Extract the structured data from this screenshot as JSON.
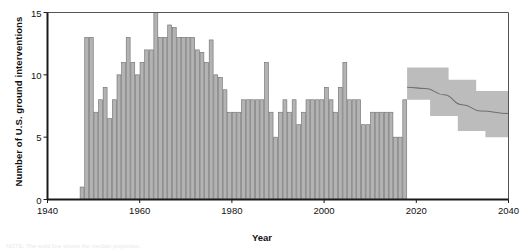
{
  "chart_data": {
    "type": "bar",
    "title": "",
    "xlabel": "Year",
    "ylabel": "Number of U.S. ground interventions",
    "xlim": [
      1940,
      2040
    ],
    "ylim": [
      0,
      15
    ],
    "xticks": [
      1940,
      1960,
      1980,
      2000,
      2020,
      2040
    ],
    "yticks": [
      0,
      5,
      10,
      15
    ],
    "grid": false,
    "legend": "none",
    "bar_color": "#b3b3b3",
    "bar_edge_color": "#6d6d6d",
    "band_color": "#bcbcbc",
    "line_color": "#6f6f6f",
    "axis_color": "#1a1a1a",
    "categories": [
      1947,
      1948,
      1949,
      1950,
      1951,
      1952,
      1953,
      1954,
      1955,
      1956,
      1957,
      1958,
      1959,
      1960,
      1961,
      1962,
      1963,
      1964,
      1965,
      1966,
      1967,
      1968,
      1969,
      1970,
      1971,
      1972,
      1973,
      1974,
      1975,
      1976,
      1977,
      1978,
      1979,
      1980,
      1981,
      1982,
      1983,
      1984,
      1985,
      1986,
      1987,
      1988,
      1989,
      1990,
      1991,
      1992,
      1993,
      1994,
      1995,
      1996,
      1997,
      1998,
      1999,
      2000,
      2001,
      2002,
      2003,
      2004,
      2005,
      2006,
      2007,
      2008,
      2009,
      2010,
      2011,
      2012,
      2013,
      2014,
      2015,
      2016,
      2017
    ],
    "values": [
      1,
      13,
      13,
      7,
      8,
      9,
      6.5,
      8,
      10,
      11,
      13,
      11,
      10,
      11,
      12,
      12,
      15.2,
      13,
      13,
      14,
      13.8,
      13,
      13,
      13,
      13,
      12,
      11.8,
      11,
      12.8,
      10,
      9.8,
      8.8,
      7,
      7,
      7,
      8,
      8,
      8,
      8,
      8,
      11,
      7,
      5,
      7,
      8,
      7,
      8,
      6,
      7,
      8,
      8,
      8,
      8,
      9,
      8,
      7,
      9,
      11,
      8,
      8,
      8,
      6,
      6,
      7,
      7,
      7,
      7,
      7,
      5,
      5,
      8
    ],
    "forecast": {
      "start_year": 2018,
      "end_year": 2040,
      "center": [
        {
          "year": 2018,
          "value": 9.0
        },
        {
          "year": 2022,
          "value": 8.9
        },
        {
          "year": 2026,
          "value": 8.4
        },
        {
          "year": 2030,
          "value": 7.6
        },
        {
          "year": 2034,
          "value": 7.1
        },
        {
          "year": 2040,
          "value": 6.9
        }
      ],
      "upper_steps": [
        {
          "from": 2018,
          "to": 2027,
          "value": 10.6
        },
        {
          "from": 2027,
          "to": 2033,
          "value": 9.6
        },
        {
          "from": 2033,
          "to": 2040,
          "value": 8.7
        }
      ],
      "lower_steps": [
        {
          "from": 2018,
          "to": 2023,
          "value": 8.0
        },
        {
          "from": 2023,
          "to": 2029,
          "value": 6.7
        },
        {
          "from": 2029,
          "to": 2035,
          "value": 5.5
        },
        {
          "from": 2035,
          "to": 2040,
          "value": 5.0
        }
      ]
    }
  },
  "footnote": "NOTE: The solid line shows the median projection."
}
